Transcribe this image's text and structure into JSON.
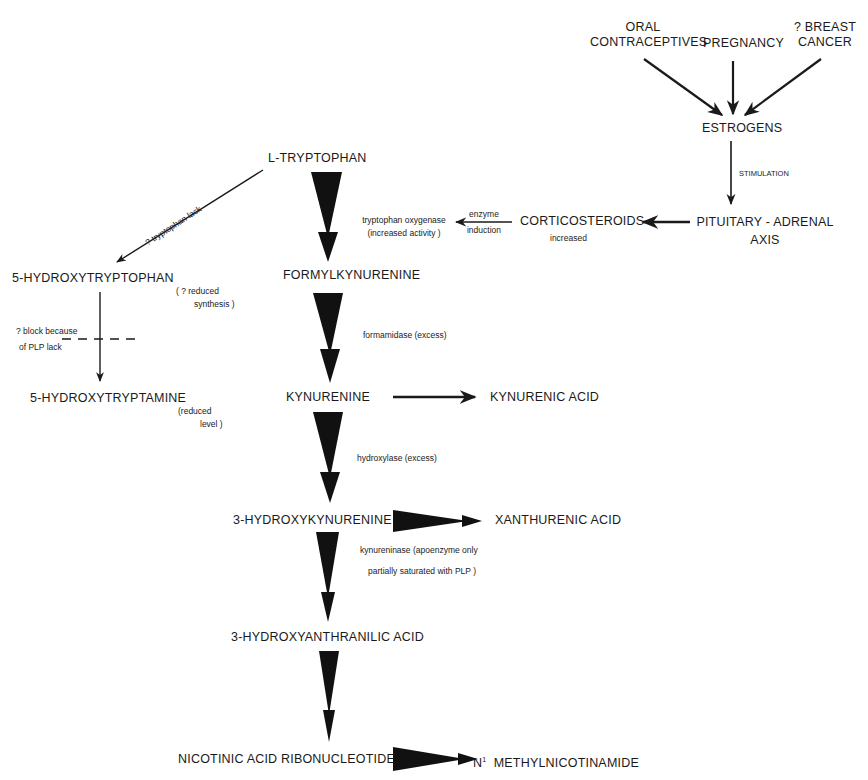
{
  "diagram": {
    "type": "metabolic-pathway",
    "nodes": {
      "oral_contraceptives": [
        "ORAL",
        "CONTRACEPTIVES"
      ],
      "pregnancy": "PREGNANCY",
      "breast_cancer": [
        "? BREAST",
        "CANCER"
      ],
      "estrogens": "ESTROGENS",
      "pituitary_adrenal": [
        "PITUITARY - ADRENAL",
        "AXIS"
      ],
      "corticosteroids": "CORTICOSTEROIDS",
      "l_tryptophan": "L-TRYPTOPHAN",
      "hydroxytryptophan": "5-HYDROXYTRYPTOPHAN",
      "hydroxytryptamine": "5-HYDROXYTRYPTAMINE",
      "formylkynurenine": "FORMYLKYNURENINE",
      "kynurenine": "KYNURENINE",
      "kynurenic_acid": "KYNURENIC  ACID",
      "hydroxykynurenine": "3-HYDROXYKYNURENINE",
      "xanthurenic_acid": "XANTHURENIC  ACID",
      "hydroxyanthranilic_acid": "3-HYDROXYANTHRANILIC  ACID",
      "nicotinic_ribonucleotide": "NICOTINIC  ACID  RIBONUCLEOTIDE",
      "methylnicotinamide_prefix": "N",
      "methylnicotinamide_sup": "1",
      "methylnicotinamide": "METHYLNICOTINAMIDE"
    },
    "annotations": {
      "stimulation": "STIMULATION",
      "corticosteroids_increased": "increased",
      "enzyme_induction": [
        "enzyme",
        "induction"
      ],
      "tryptophan_oxygenase": [
        "tryptophan  oxygenase",
        "(increased  activity )"
      ],
      "tryptophan_lack": "? tryptophan  lack",
      "reduced_synthesis": [
        "( ? reduced",
        "synthesis )"
      ],
      "block_plp": [
        "? block   because",
        "of   PLP   lack"
      ],
      "reduced_level": [
        "(reduced",
        "level )"
      ],
      "formamidase": "formamidase  (excess)",
      "hydroxylase": "hydroxylase  (excess)",
      "kynureninase": [
        "kynureninase  (apoenzyme  only",
        "partially  saturated  with  PLP )"
      ]
    },
    "edges": [
      {
        "from": "ORAL CONTRACEPTIVES",
        "to": "ESTROGENS",
        "style": "arrow"
      },
      {
        "from": "PREGNANCY",
        "to": "ESTROGENS",
        "style": "arrow"
      },
      {
        "from": "? BREAST CANCER",
        "to": "ESTROGENS",
        "style": "arrow"
      },
      {
        "from": "ESTROGENS",
        "to": "PITUITARY - ADRENAL AXIS",
        "label": "STIMULATION",
        "style": "arrow"
      },
      {
        "from": "PITUITARY - ADRENAL AXIS",
        "to": "CORTICOSTEROIDS",
        "style": "arrow"
      },
      {
        "from": "CORTICOSTEROIDS",
        "to": "tryptophan oxygenase",
        "label": "enzyme induction",
        "style": "arrow"
      },
      {
        "from": "L-TRYPTOPHAN",
        "to": "5-HYDROXYTRYPTOPHAN",
        "label": "? tryptophan lack",
        "style": "arrow"
      },
      {
        "from": "5-HYDROXYTRYPTOPHAN",
        "to": "5-HYDROXYTRYPTAMINE",
        "label": "? block because of PLP lack",
        "style": "blocked-arrow"
      },
      {
        "from": "L-TRYPTOPHAN",
        "to": "FORMYLKYNURENINE",
        "style": "wedge"
      },
      {
        "from": "FORMYLKYNURENINE",
        "to": "KYNURENINE",
        "label": "formamidase (excess)",
        "style": "wedge"
      },
      {
        "from": "KYNURENINE",
        "to": "KYNURENIC ACID",
        "style": "arrow"
      },
      {
        "from": "KYNURENINE",
        "to": "3-HYDROXYKYNURENINE",
        "label": "hydroxylase (excess)",
        "style": "wedge"
      },
      {
        "from": "3-HYDROXYKYNURENINE",
        "to": "XANTHURENIC ACID",
        "style": "wedge"
      },
      {
        "from": "3-HYDROXYKYNURENINE",
        "to": "3-HYDROXYANTHRANILIC ACID",
        "label": "kynureninase (apoenzyme only partially saturated with PLP)",
        "style": "wedge"
      },
      {
        "from": "3-HYDROXYANTHRANILIC ACID",
        "to": "NICOTINIC ACID RIBONUCLEOTIDE",
        "style": "wedge"
      },
      {
        "from": "NICOTINIC ACID RIBONUCLEOTIDE",
        "to": "N1 METHYLNICOTINAMIDE",
        "style": "wedge"
      }
    ],
    "colors": {
      "ink": "#1a1a1a",
      "background": "#ffffff"
    }
  }
}
